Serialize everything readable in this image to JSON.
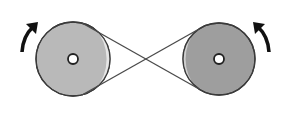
{
  "diagram": {
    "title": "Crossed belt drive between two pulleys",
    "colors": {
      "background": "#ffffff",
      "outline": "#3a3a3a",
      "belt": "#4a4a4a",
      "left_pulley_fill": "#b9b9b9",
      "right_pulley_fill": "#9e9e9e",
      "crescent": "#e6e6e6",
      "arrow": "#111111",
      "hub": "#ffffff"
    },
    "pulleys": [
      {
        "id": "left",
        "label": "Left pulley",
        "cx": 73,
        "cy": 59,
        "r": 37
      },
      {
        "id": "right",
        "label": "Right pulley",
        "cx": 219,
        "cy": 59,
        "r": 36
      }
    ],
    "arrows": [
      {
        "id": "left",
        "label": "Rotation arrow (clockwise)"
      },
      {
        "id": "right",
        "label": "Rotation arrow (counter-clockwise)"
      }
    ]
  }
}
